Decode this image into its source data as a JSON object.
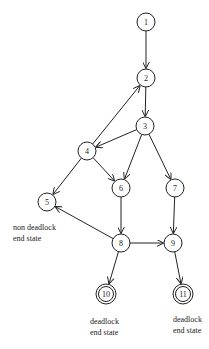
{
  "diagram": {
    "type": "state-transition-graph",
    "nodes": [
      {
        "id": "1",
        "x": 146,
        "y": 22,
        "final": false
      },
      {
        "id": "2",
        "x": 146,
        "y": 78,
        "final": false
      },
      {
        "id": "3",
        "x": 145,
        "y": 126,
        "final": false
      },
      {
        "id": "4",
        "x": 87,
        "y": 151,
        "final": false
      },
      {
        "id": "5",
        "x": 47,
        "y": 202,
        "final": false
      },
      {
        "id": "6",
        "x": 121,
        "y": 188,
        "final": false
      },
      {
        "id": "7",
        "x": 175,
        "y": 188,
        "final": false
      },
      {
        "id": "8",
        "x": 121,
        "y": 243,
        "final": false
      },
      {
        "id": "9",
        "x": 173,
        "y": 243,
        "final": false
      },
      {
        "id": "10",
        "x": 106,
        "y": 294,
        "final": true
      },
      {
        "id": "11",
        "x": 183,
        "y": 294,
        "final": true
      }
    ],
    "edges": [
      {
        "from": "1",
        "to": "2"
      },
      {
        "from": "2",
        "to": "3"
      },
      {
        "from": "3",
        "to": "4"
      },
      {
        "from": "4",
        "to": "2"
      },
      {
        "from": "3",
        "to": "6"
      },
      {
        "from": "3",
        "to": "7"
      },
      {
        "from": "4",
        "to": "5"
      },
      {
        "from": "4",
        "to": "6"
      },
      {
        "from": "6",
        "to": "8"
      },
      {
        "from": "7",
        "to": "9"
      },
      {
        "from": "8",
        "to": "5"
      },
      {
        "from": "8",
        "to": "9"
      },
      {
        "from": "8",
        "to": "10"
      },
      {
        "from": "9",
        "to": "11"
      }
    ],
    "annotations": {
      "non_deadlock": {
        "line1": "non deadlock",
        "line2": "end state"
      },
      "deadlock_10": {
        "line1": "deadlock",
        "line2": "end state"
      },
      "deadlock_11": {
        "line1": "deadlock",
        "line2": "end state"
      }
    }
  }
}
